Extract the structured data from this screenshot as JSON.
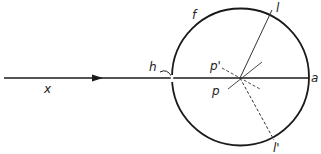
{
  "diagram": {
    "labels": {
      "x": "x",
      "h": "h",
      "f": "f",
      "l": "l",
      "l_prime": "l'",
      "p": "p",
      "p_prime": "p'",
      "a": "a"
    },
    "colors": {
      "stroke": "#1a1a1a",
      "background": "#ffffff"
    }
  }
}
